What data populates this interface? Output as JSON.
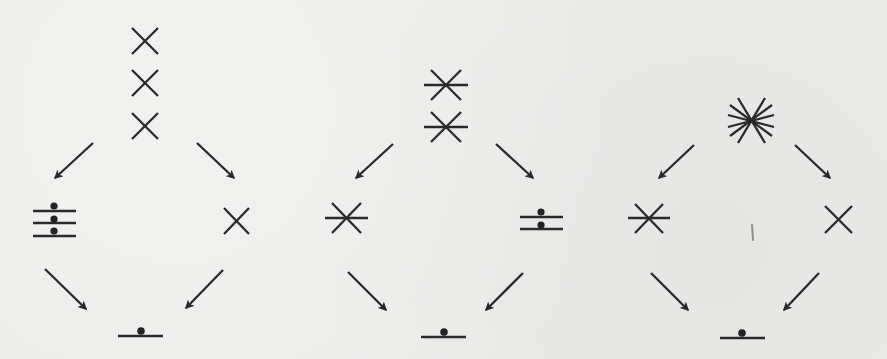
{
  "figure": {
    "colors": {
      "ink": "#2a2a2a",
      "paper": "#ebebe9"
    },
    "glyph_legend": {
      "x": "two-line cross (X)",
      "x3": "three-line star (X with horizontal bar)",
      "x6": "six-line star (asterisk burst)",
      "bar1": "single horizontal bar with dot",
      "bar2": "two stacked bars with dots",
      "bar3": "three stacked bars with dots"
    },
    "trees": [
      {
        "id": "tree-1",
        "root": {
          "glyph": "x",
          "count": 3,
          "layout": "vertical stack"
        },
        "left_child": {
          "glyph": "bar3"
        },
        "right_child": {
          "glyph": "x"
        },
        "leaf": {
          "glyph": "bar1"
        }
      },
      {
        "id": "tree-2",
        "root": {
          "glyph": "x3",
          "count": 2,
          "layout": "vertical stack"
        },
        "left_child": {
          "glyph": "x3"
        },
        "right_child": {
          "glyph": "bar2"
        },
        "leaf": {
          "glyph": "bar1"
        }
      },
      {
        "id": "tree-3",
        "root": {
          "glyph": "x6",
          "count": 1,
          "layout": "single"
        },
        "left_child": {
          "glyph": "x3"
        },
        "right_child": {
          "glyph": "x"
        },
        "leaf": {
          "glyph": "bar1"
        }
      }
    ]
  }
}
